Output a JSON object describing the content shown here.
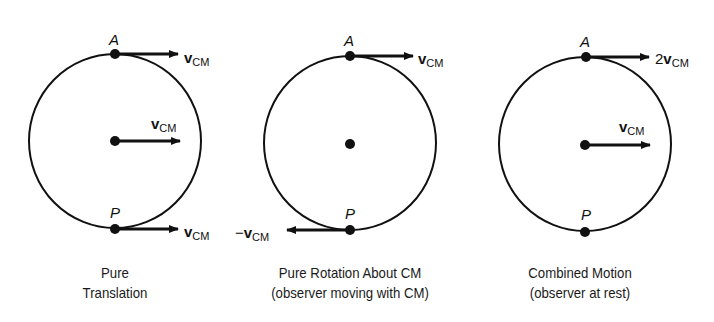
{
  "figure": {
    "panels": [
      {
        "id": "pure-translation",
        "caption_line1": "Pure",
        "caption_line2": "Translation",
        "top_point": "A",
        "bottom_point": "P",
        "top_vector": {
          "prefix": "",
          "symbol": "v",
          "subscript": "CM"
        },
        "center_vector": {
          "prefix": "",
          "symbol": "v",
          "subscript": "CM"
        },
        "bottom_vector": {
          "prefix": "",
          "symbol": "v",
          "subscript": "CM"
        }
      },
      {
        "id": "pure-rotation",
        "caption_line1": "Pure Rotation About CM",
        "caption_line2": "(observer moving with CM)",
        "top_point": "A",
        "bottom_point": "P",
        "top_vector": {
          "prefix": "",
          "symbol": "v",
          "subscript": "CM"
        },
        "bottom_vector": {
          "prefix": "−",
          "symbol": "v",
          "subscript": "CM"
        }
      },
      {
        "id": "combined-motion",
        "caption_line1": "Combined Motion",
        "caption_line2": "(observer at rest)",
        "top_point": "A",
        "bottom_point": "P",
        "top_vector": {
          "prefix": "2",
          "symbol": "v",
          "subscript": "CM"
        },
        "center_vector": {
          "prefix": "",
          "symbol": "v",
          "subscript": "CM"
        }
      }
    ],
    "colors": {
      "ink": "#111111",
      "background": "#ffffff"
    }
  }
}
